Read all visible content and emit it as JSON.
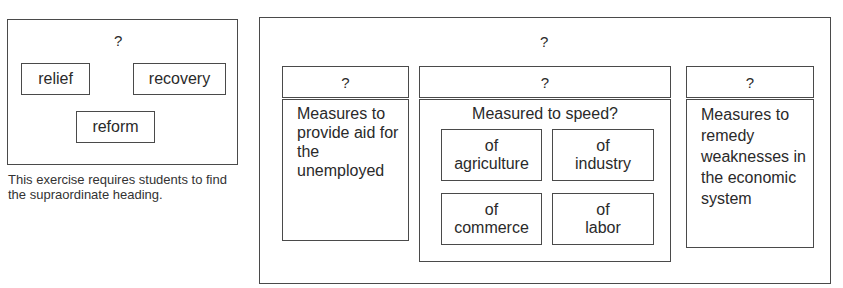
{
  "left_exercise": {
    "heading": "?",
    "items": [
      "relief",
      "recovery",
      "reform"
    ],
    "caption": "This exercise requires students to find the supraordinate heading."
  },
  "right_exercise": {
    "heading": "?",
    "columns": [
      {
        "heading": "?",
        "body": "Measures to provide aid for the unemployed"
      },
      {
        "heading": "?",
        "body": "Measured to speed?",
        "subitems": [
          {
            "line1": "of",
            "line2": "agriculture"
          },
          {
            "line1": "of",
            "line2": "industry"
          },
          {
            "line1": "of",
            "line2": "commerce"
          },
          {
            "line1": "of",
            "line2": "labor"
          }
        ]
      },
      {
        "heading": "?",
        "body": "Measures to remedy weaknesses in the economic system"
      }
    ]
  }
}
